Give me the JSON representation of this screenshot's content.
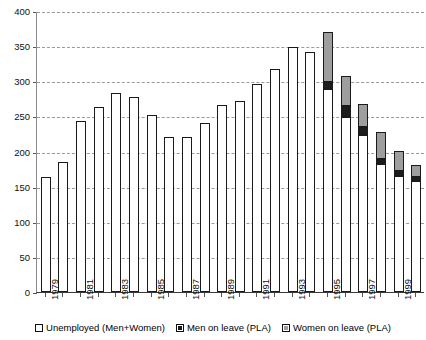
{
  "chart_data": {
    "type": "bar",
    "title": "",
    "subtitle": "",
    "xlabel": "",
    "ylabel": "",
    "stacked": true,
    "grid": true,
    "legend_position": "bottom",
    "ylim": [
      0,
      400
    ],
    "yticks": [
      0,
      50,
      100,
      150,
      200,
      250,
      300,
      350,
      400
    ],
    "categories": [
      "1979",
      "1980",
      "1981",
      "1982",
      "1983",
      "1984",
      "1985",
      "1986",
      "1987",
      "1988",
      "1989",
      "1990",
      "1991",
      "1992",
      "1993",
      "1994",
      "1995",
      "1996",
      "1997",
      "1998",
      "1999",
      "2000"
    ],
    "xtick_labels_shown": [
      "1979",
      "1981",
      "1983",
      "1985",
      "1987",
      "1989",
      "1991",
      "1993",
      "1995",
      "1997",
      "1999"
    ],
    "series": [
      {
        "name": "Unemployed (Men+Women)",
        "color": "#ffffff",
        "values": [
          164,
          185,
          243,
          264,
          283,
          277,
          252,
          221,
          221,
          241,
          266,
          272,
          296,
          318,
          349,
          342,
          289,
          249,
          223,
          182,
          165,
          158
        ]
      },
      {
        "name": "Men on leave (PLA)",
        "color": "#1c1c1c",
        "values": [
          0,
          0,
          0,
          0,
          0,
          0,
          0,
          0,
          0,
          0,
          0,
          0,
          0,
          0,
          0,
          0,
          10,
          16,
          12,
          8,
          7,
          6
        ]
      },
      {
        "name": "Women on leave (PLA)",
        "color": "#9e9e9e",
        "values": [
          0,
          0,
          0,
          0,
          0,
          0,
          0,
          0,
          0,
          0,
          0,
          0,
          0,
          0,
          0,
          0,
          71,
          43,
          33,
          38,
          29,
          17
        ]
      }
    ],
    "totals": [
      164,
      185,
      243,
      264,
      283,
      277,
      252,
      221,
      221,
      241,
      266,
      272,
      296,
      318,
      349,
      342,
      370,
      308,
      268,
      228,
      201,
      181
    ]
  },
  "legend": {
    "items": [
      {
        "label": "Unemployed (Men+Women)",
        "swatch": "unemployed"
      },
      {
        "label": "Men on leave (PLA)",
        "swatch": "men"
      },
      {
        "label": "Women on leave (PLA)",
        "swatch": "women"
      }
    ]
  }
}
